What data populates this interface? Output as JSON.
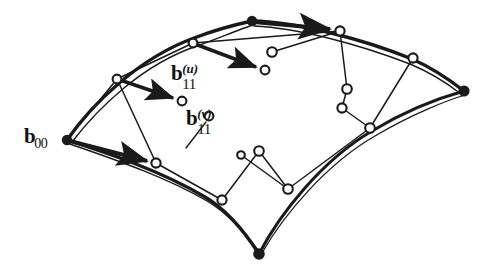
{
  "figure": {
    "type": "diagram",
    "background_color": "#ffffff",
    "ink_color": "#1a1a1a",
    "width": 495,
    "height": 273
  },
  "labels": {
    "b00": {
      "base": "b",
      "sub": "00",
      "sup": "",
      "x": 24,
      "y": 126
    },
    "b11u": {
      "base": "b",
      "sub": "11",
      "sup": "(u)",
      "x": 171,
      "y": 63
    },
    "b11v": {
      "base": "b",
      "sub": "11",
      "sup": "(v)",
      "x": 186,
      "y": 108
    }
  },
  "corner_points": [
    {
      "name": "b00-corner",
      "x": 67,
      "y": 140,
      "style": "filled"
    },
    {
      "name": "b30-corner",
      "x": 252,
      "y": 21,
      "style": "filled"
    },
    {
      "name": "b33-corner",
      "x": 464,
      "y": 91,
      "style": "filled"
    },
    {
      "name": "b03-corner",
      "x": 259,
      "y": 254,
      "style": "filled"
    }
  ],
  "control_points": [
    {
      "name": "cp-upper-left-1",
      "x": 117,
      "y": 79,
      "style": "open"
    },
    {
      "name": "cp-upper-left-2",
      "x": 193,
      "y": 43,
      "style": "open"
    },
    {
      "name": "cp-top-right-1",
      "x": 340,
      "y": 31,
      "style": "open"
    },
    {
      "name": "cp-top-right-2",
      "x": 413,
      "y": 58,
      "style": "open"
    },
    {
      "name": "cp-b11u",
      "x": 182,
      "y": 101,
      "style": "open"
    },
    {
      "name": "cp-interior-upper",
      "x": 265,
      "y": 70,
      "style": "open"
    },
    {
      "name": "cp-interior-top",
      "x": 272,
      "y": 52,
      "style": "open"
    },
    {
      "name": "cp-interior-right-upper",
      "x": 347,
      "y": 89,
      "style": "open"
    },
    {
      "name": "cp-interior-right-lower",
      "x": 342,
      "y": 108,
      "style": "open"
    },
    {
      "name": "cp-right-lower-edge",
      "x": 370,
      "y": 128,
      "style": "open"
    },
    {
      "name": "cp-b11v",
      "x": 209,
      "y": 116,
      "style": "open"
    },
    {
      "name": "cp-lower-left-edge",
      "x": 156,
      "y": 163,
      "style": "open"
    },
    {
      "name": "cp-interior-bottom-small",
      "x": 241,
      "y": 155,
      "style": "open"
    },
    {
      "name": "cp-interior-bottom",
      "x": 259,
      "y": 151,
      "style": "open"
    },
    {
      "name": "cp-bottom-junction-left",
      "x": 222,
      "y": 200,
      "style": "open"
    },
    {
      "name": "cp-bottom-junction-right",
      "x": 288,
      "y": 189,
      "style": "open"
    }
  ],
  "arrows": [
    {
      "name": "arrow-b30-to-top-right",
      "from": [
        252,
        21
      ],
      "to": [
        340,
        31
      ]
    },
    {
      "name": "arrow-to-b11u",
      "from": [
        117,
        79
      ],
      "to": [
        182,
        101
      ]
    },
    {
      "name": "arrow-interior-upper",
      "from": [
        193,
        43
      ],
      "to": [
        265,
        70
      ]
    },
    {
      "name": "arrow-b00-to-lower-left",
      "from": [
        67,
        140
      ],
      "to": [
        156,
        163
      ]
    }
  ],
  "leader_lines": [
    {
      "name": "leader-b11v",
      "from": [
        209,
        116
      ],
      "to": [
        188,
        145
      ]
    }
  ]
}
